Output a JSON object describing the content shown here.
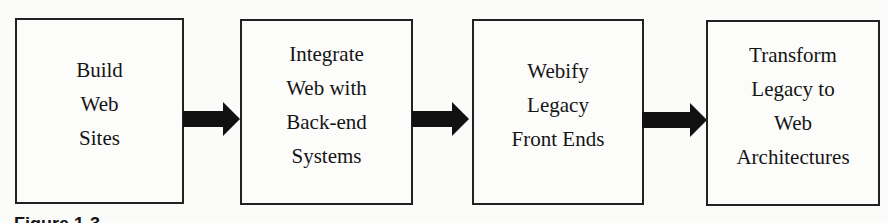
{
  "diagram": {
    "type": "flowchart",
    "direction": "left-to-right",
    "steps": [
      {
        "label": "Build\nWeb\nSites"
      },
      {
        "label": "Integrate\nWeb with\nBack-end\nSystems"
      },
      {
        "label": "Webify\nLegacy\nFront Ends"
      },
      {
        "label": "Transform\nLegacy to\nWeb\nArchitectures"
      }
    ],
    "connectors": [
      {
        "from": 0,
        "to": 1,
        "style": "block-arrow"
      },
      {
        "from": 1,
        "to": 2,
        "style": "block-arrow"
      },
      {
        "from": 2,
        "to": 3,
        "style": "block-arrow"
      }
    ],
    "caption": "Figure 1-3"
  }
}
